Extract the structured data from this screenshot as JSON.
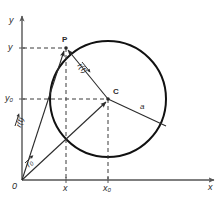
{
  "figure": {
    "title": "",
    "type": "geometry-diagram",
    "colors": {
      "ink": "#2b2b2b",
      "circle": "#1a1a1a",
      "axis": "#555555",
      "dashed": "#3a3a3a",
      "background": "#ffffff"
    }
  },
  "axes": {
    "x_label": "x",
    "y_label": "y",
    "origin_label": "0"
  },
  "ticks": {
    "x": "x",
    "x0": "x",
    "x0_sub": "0",
    "y": "y",
    "y0": "y",
    "y0_sub": "0"
  },
  "points": {
    "p_label": "P",
    "c_label": "C"
  },
  "vectors": {
    "r_of_t_from_origin": "r(t)",
    "r_of_t_from_center": "r(t)",
    "r_zero": "r",
    "r_zero_sub": "0"
  },
  "measures": {
    "radius_label": "a"
  },
  "geometry": {
    "circle_center_x": 108,
    "circle_center_y": 99,
    "circle_radius": 58,
    "point_p_x": 66,
    "point_p_y": 48,
    "origin_x": 22,
    "origin_y": 180,
    "radius_end_x": 166,
    "radius_end_y": 126
  }
}
